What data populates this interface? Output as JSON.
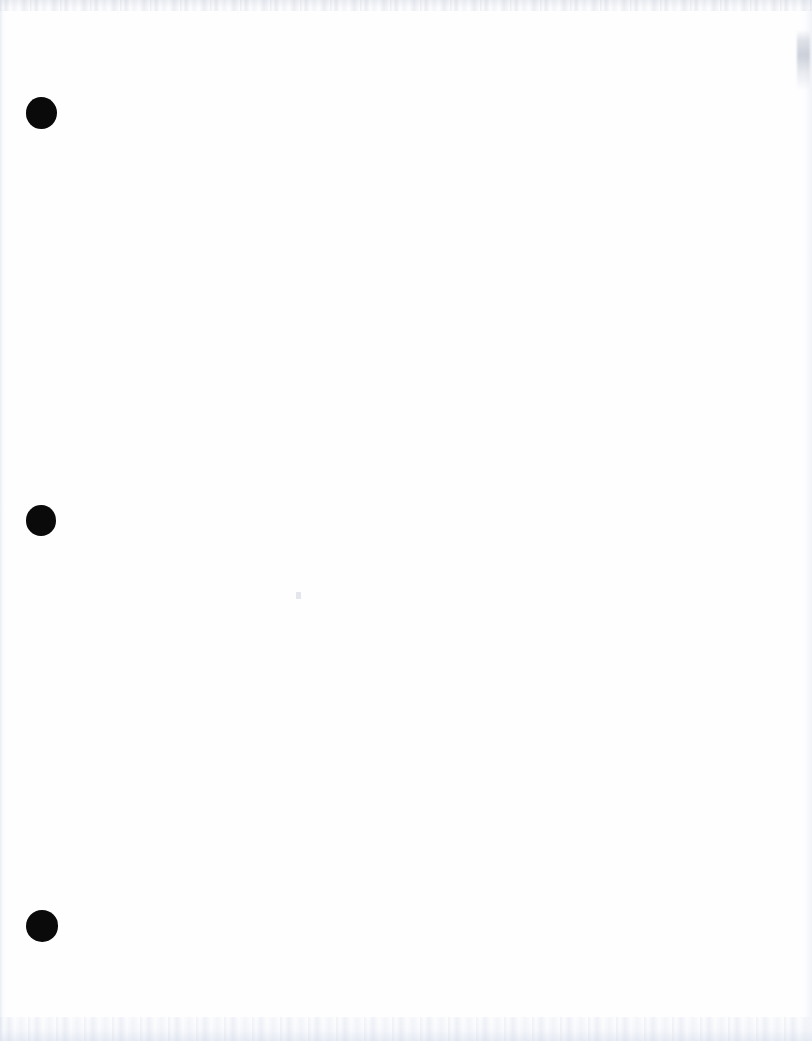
{
  "document": {
    "kind": "scanned-page",
    "content_state": "blank",
    "body_text": "",
    "page_width": 812,
    "page_height": 1041,
    "background_color": "#ffffff",
    "paper_tint": "#fefeff"
  },
  "binder_holes": {
    "count": 3,
    "color": "#0a0a0a",
    "margin_side": "left",
    "items": [
      {
        "name": "top-hole",
        "center_x": 41,
        "center_y": 113,
        "diameter": 31
      },
      {
        "name": "middle-hole",
        "center_x": 41,
        "center_y": 521,
        "diameter": 30
      },
      {
        "name": "bottom-hole",
        "center_x": 41,
        "center_y": 926,
        "diameter": 32
      }
    ]
  },
  "scan_artifacts": {
    "top_band": {
      "label": "top scanner noise band",
      "color": "#e2e5ec",
      "height": 11
    },
    "bottom_band": {
      "label": "bottom scanner noise band",
      "color": "#e6ebf2",
      "height": 24
    },
    "left_edge": {
      "label": "left paper edge shading",
      "color": "#e6ecf4",
      "width": 6
    },
    "right_edge": {
      "label": "right paper edge shading",
      "color": "#eaeef4",
      "width": 12
    },
    "right_smudge": {
      "label": "gray smudge near right edge",
      "color": "#b6bcc8",
      "x": 797,
      "y": 30,
      "width": 13,
      "height": 60
    },
    "dust_speck": {
      "label": "dust speck",
      "color": "#dee2ea",
      "x": 296,
      "y": 592,
      "width": 5,
      "height": 7
    }
  }
}
